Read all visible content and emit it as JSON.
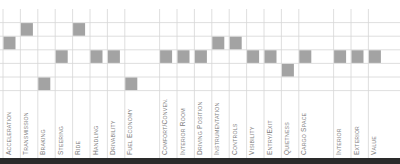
{
  "chart_data": {
    "type": "heatmap",
    "title": "",
    "xlabel": "",
    "ylabel": "",
    "levels": 6,
    "level_order": "bottom-to-top (1 = lowest row, 6 = top row)",
    "grid": true,
    "categories": [
      "Acceleration",
      "Transmission",
      "Braking",
      "Steering",
      "Ride",
      "Handling",
      "Drivability",
      "Fuel Economy",
      "",
      "Comfort/Conven.",
      "Interior Room",
      "Driving Position",
      "Instrumentation",
      "Controls",
      "Visibility",
      "Entry/Exit",
      "Quietness",
      "Cargo Space",
      "",
      "Interior",
      "Exterior",
      "Value"
    ],
    "values": [
      4,
      5,
      1,
      3,
      5,
      3,
      3,
      1,
      null,
      3,
      3,
      3,
      4,
      4,
      3,
      3,
      2,
      3,
      null,
      3,
      3,
      3
    ],
    "colors": {
      "square": "#a3a3a3",
      "grid": "#d6d6d6",
      "label": "#7a7a7a",
      "bottom_bar": "#2a2a2a"
    }
  }
}
